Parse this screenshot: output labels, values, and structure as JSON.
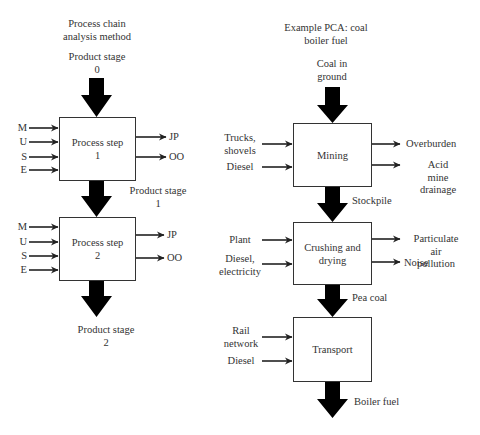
{
  "left_panel": {
    "title": "Process chain\nanalysis method",
    "input_stage": "Product stage\n0",
    "steps": [
      {
        "label": "Process step\n1",
        "inputs": [
          "M",
          "U",
          "S",
          "E"
        ],
        "outputs": [
          "JP",
          "OO"
        ],
        "output_stage": "Product stage\n1"
      },
      {
        "label": "Process step\n2",
        "inputs": [
          "M",
          "U",
          "S",
          "E"
        ],
        "outputs": [
          "JP",
          "OO"
        ],
        "output_stage": "Product stage\n2"
      }
    ]
  },
  "right_panel": {
    "title": "Example PCA: coal\nboiler fuel",
    "input_stage": "Coal in\nground",
    "steps": [
      {
        "label": "Mining",
        "inputs": [
          "Trucks,\nshovels",
          "Diesel"
        ],
        "outputs": [
          "Overburden",
          "Acid mine\ndrainage"
        ],
        "output_stage": "Stockpile"
      },
      {
        "label": "Crushing and\ndrying",
        "inputs": [
          "Plant",
          "Diesel,\nelectricity"
        ],
        "outputs": [
          "Particulate air\npollution",
          "Noise"
        ],
        "output_stage": "Pea coal"
      },
      {
        "label": "Transport",
        "inputs": [
          "Rail\nnetwork",
          "Diesel"
        ],
        "outputs": [],
        "output_stage": "Boiler fuel"
      }
    ]
  },
  "colors": {
    "stroke": "#222222",
    "text": "#333333",
    "fill_arrow": "#000000",
    "background": "#ffffff"
  }
}
